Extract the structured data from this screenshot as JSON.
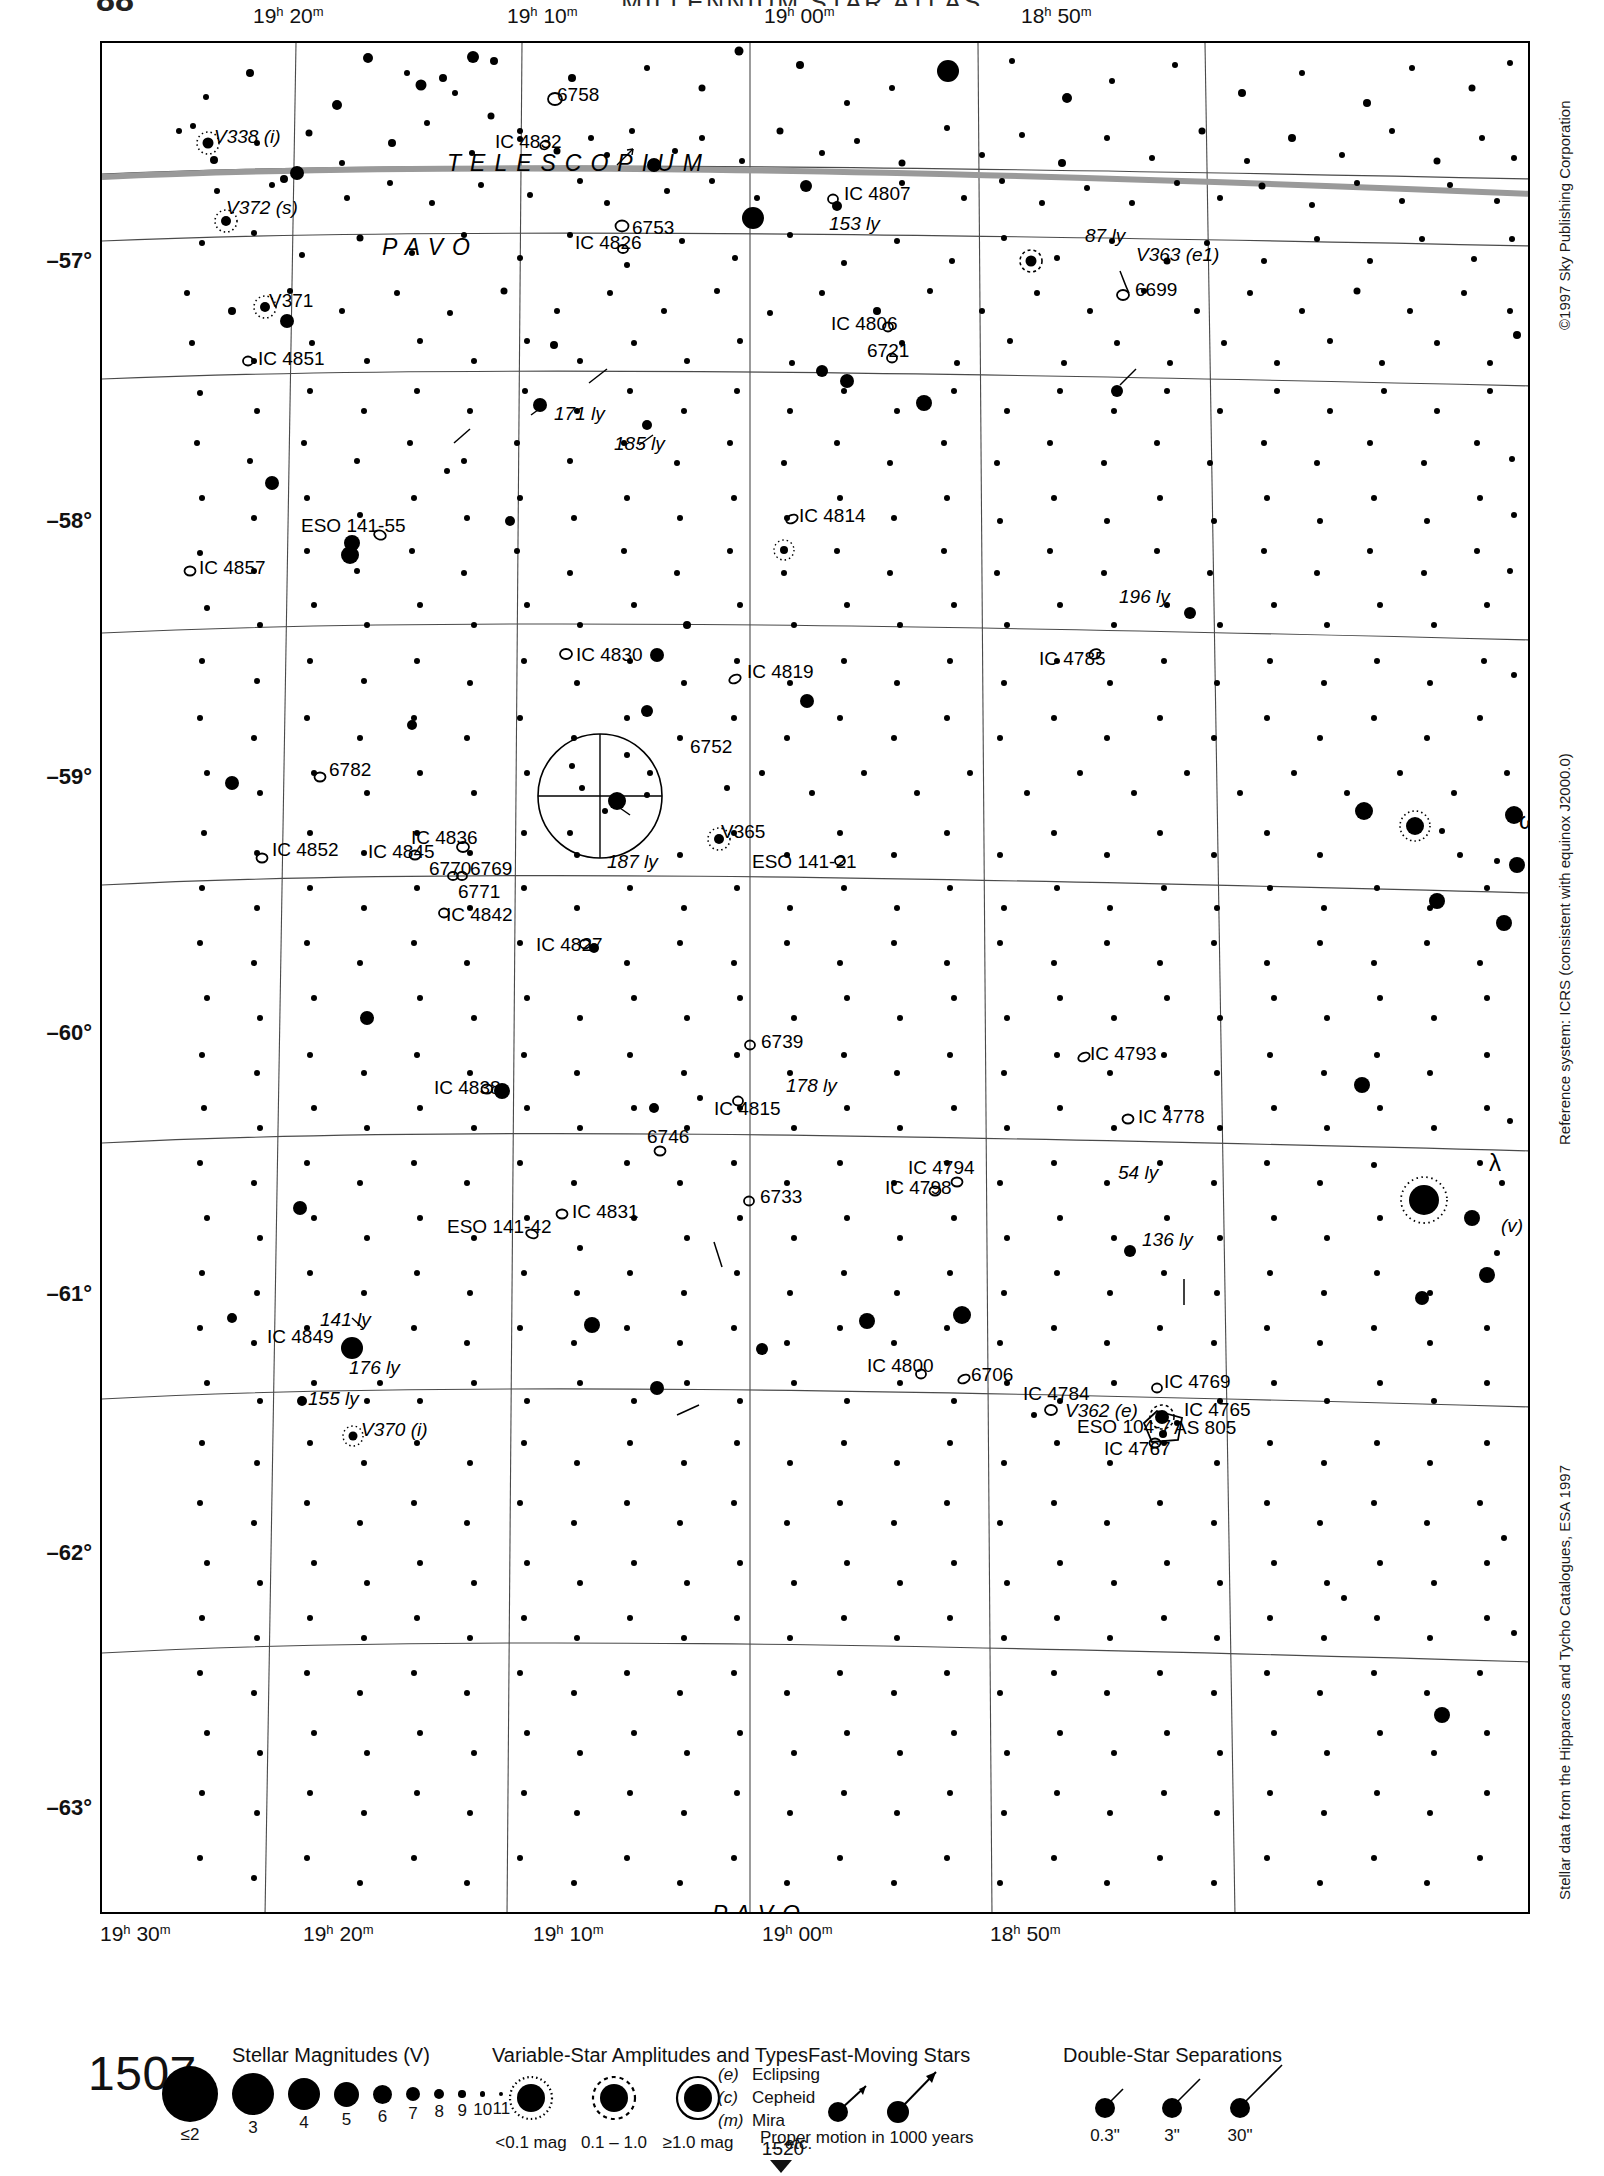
{
  "header": {
    "atlas_title": "MILLENNIUM STAR ATLAS",
    "page_number": "88"
  },
  "chart": {
    "number": "1507",
    "next_chart": "1520",
    "ra_labels_top": [
      "19h 20m",
      "19h 10m",
      "19h 00m",
      "18h 50m"
    ],
    "ra_labels_bottom": [
      "19h 30m",
      "19h 20m",
      "19h 10m",
      "19h 00m",
      "18h 50m"
    ],
    "dec_labels": [
      "–57°",
      "–58°",
      "–59°",
      "–60°",
      "–61°",
      "–62°",
      "–63°"
    ],
    "constellation_labels": [
      {
        "name": "TELESCOPIUM",
        "x": 345,
        "y": 128,
        "size": 23,
        "spacing": 9
      },
      {
        "name": "PAVO",
        "x": 280,
        "y": 212,
        "size": 23,
        "spacing": 9
      },
      {
        "name": "PAVO",
        "x": 610,
        "y": 1879,
        "size": 23,
        "spacing": 9
      }
    ]
  },
  "margins": {
    "copyright": "©1997 Sky Publishing Corporation",
    "reference_system": "Reference system: ICRS (consistent with equinox J2000.0)",
    "data_source": "Stellar data from the Hipparcos and Tycho Catalogues, ESA 1997"
  },
  "legend": {
    "magnitudes": {
      "title": "Stellar Magnitudes (V)",
      "labels": [
        "≤2",
        "3",
        "4",
        "5",
        "6",
        "7",
        "8",
        "9",
        "10",
        "11"
      ],
      "radii": [
        28,
        21,
        16,
        12.5,
        9.5,
        7,
        5.2,
        3.8,
        2.7,
        1.9
      ]
    },
    "variable_stars": {
      "title": "Variable-Star Amplitudes and Types",
      "amplitude_labels": [
        "<0.1 mag",
        "0.1 – 1.0",
        "≥1.0 mag"
      ],
      "types": [
        {
          "code": "(e)",
          "label": "Eclipsing"
        },
        {
          "code": "(c)",
          "label": "Cepheid"
        },
        {
          "code": "(m)",
          "label": "Mira"
        },
        {
          "code": "",
          "label": "... etc."
        }
      ]
    },
    "fast_moving": {
      "title": "Fast-Moving Stars",
      "caption": "Proper motion in 1000 years"
    },
    "double_stars": {
      "title": "Double-Star Separations",
      "labels": [
        "0.3\"",
        "3\"",
        "30\""
      ]
    }
  },
  "chart_data": {
    "type": "scatter",
    "xlabel": "Right Ascension (J2000)",
    "ylabel": "Declination (J2000)",
    "xlim": [
      "19h 32m",
      "18h 48m"
    ],
    "ylim": [
      -63.6,
      -56.4
    ],
    "grid": true,
    "legend_position": "bottom",
    "object_labels": [
      {
        "text": "V338 (i)",
        "x": 112,
        "y": 100,
        "italic_tail": true
      },
      {
        "text": "6758",
        "x": 455,
        "y": 58,
        "italic_tail": false
      },
      {
        "text": "IC 4832",
        "x": 393,
        "y": 105,
        "italic_tail": false
      },
      {
        "text": "IC 4807",
        "x": 742,
        "y": 157,
        "italic_tail": false
      },
      {
        "text": "153 ly",
        "x": 727,
        "y": 187,
        "italic_tail": true
      },
      {
        "text": "87 ly",
        "x": 983,
        "y": 199,
        "italic_tail": true
      },
      {
        "text": "V363 (e1)",
        "x": 1034,
        "y": 218,
        "italic_tail": true
      },
      {
        "text": "6699",
        "x": 1033,
        "y": 253,
        "italic_tail": false
      },
      {
        "text": "V372 (s)",
        "x": 124,
        "y": 171,
        "italic_tail": true
      },
      {
        "text": "6753",
        "x": 530,
        "y": 191,
        "italic_tail": false
      },
      {
        "text": "IC 4826",
        "x": 473,
        "y": 206,
        "italic_tail": false
      },
      {
        "text": "IC 4806",
        "x": 729,
        "y": 287,
        "italic_tail": false
      },
      {
        "text": "6721",
        "x": 765,
        "y": 314,
        "italic_tail": false
      },
      {
        "text": "V371",
        "x": 167,
        "y": 264,
        "italic_tail": false
      },
      {
        "text": "IC 4851",
        "x": 156,
        "y": 322,
        "italic_tail": false
      },
      {
        "text": "171 ly",
        "x": 452,
        "y": 377,
        "italic_tail": true
      },
      {
        "text": "185 ly",
        "x": 512,
        "y": 407,
        "italic_tail": true
      },
      {
        "text": "IC 4814",
        "x": 697,
        "y": 479,
        "italic_tail": false
      },
      {
        "text": "ESO 141-55",
        "x": 199,
        "y": 489,
        "italic_tail": false
      },
      {
        "text": "IC 4857",
        "x": 97,
        "y": 531,
        "italic_tail": false
      },
      {
        "text": "196 ly",
        "x": 1017,
        "y": 560,
        "italic_tail": true
      },
      {
        "text": "IC 4830",
        "x": 474,
        "y": 618,
        "italic_tail": false
      },
      {
        "text": "IC 4819",
        "x": 645,
        "y": 635,
        "italic_tail": false
      },
      {
        "text": "IC 4785",
        "x": 937,
        "y": 622,
        "italic_tail": false
      },
      {
        "text": "6752",
        "x": 588,
        "y": 710,
        "italic_tail": false
      },
      {
        "text": "6782",
        "x": 227,
        "y": 733,
        "italic_tail": false
      },
      {
        "text": "V365",
        "x": 619,
        "y": 795,
        "italic_tail": false
      },
      {
        "text": "ω",
        "x": 1417,
        "y": 786,
        "italic_tail": false
      },
      {
        "text": "IC 4836",
        "x": 309,
        "y": 801,
        "italic_tail": false
      },
      {
        "text": "187 ly",
        "x": 505,
        "y": 825,
        "italic_tail": true
      },
      {
        "text": "IC 4852",
        "x": 170,
        "y": 813,
        "italic_tail": false
      },
      {
        "text": "IC 4845",
        "x": 266,
        "y": 815,
        "italic_tail": false
      },
      {
        "text": "ESO 141-21",
        "x": 650,
        "y": 825,
        "italic_tail": false
      },
      {
        "text": "6770",
        "x": 327,
        "y": 832,
        "italic_tail": false
      },
      {
        "text": "6769",
        "x": 368,
        "y": 832,
        "italic_tail": false
      },
      {
        "text": "6771",
        "x": 356,
        "y": 855,
        "italic_tail": false
      },
      {
        "text": "IC 4842",
        "x": 344,
        "y": 878,
        "italic_tail": false
      },
      {
        "text": "IC 4827",
        "x": 434,
        "y": 908,
        "italic_tail": false
      },
      {
        "text": "6739",
        "x": 659,
        "y": 1005,
        "italic_tail": false
      },
      {
        "text": "IC 4793",
        "x": 988,
        "y": 1017,
        "italic_tail": false
      },
      {
        "text": "IC 4838",
        "x": 332,
        "y": 1051,
        "italic_tail": false
      },
      {
        "text": "178 ly",
        "x": 684,
        "y": 1049,
        "italic_tail": true
      },
      {
        "text": "IC 4815",
        "x": 612,
        "y": 1072,
        "italic_tail": false
      },
      {
        "text": "IC 4778",
        "x": 1036,
        "y": 1080,
        "italic_tail": false
      },
      {
        "text": "6746",
        "x": 545,
        "y": 1100,
        "italic_tail": false
      },
      {
        "text": "IC 4794",
        "x": 806,
        "y": 1131,
        "italic_tail": false
      },
      {
        "text": "54 ly",
        "x": 1016,
        "y": 1136,
        "italic_tail": true
      },
      {
        "text": "IC 4798",
        "x": 783,
        "y": 1151,
        "italic_tail": false
      },
      {
        "text": "λ",
        "x": 1387,
        "y": 1128,
        "italic_tail": false
      },
      {
        "text": "6733",
        "x": 658,
        "y": 1160,
        "italic_tail": false
      },
      {
        "text": "IC 4831",
        "x": 470,
        "y": 1175,
        "italic_tail": false
      },
      {
        "text": "(v)",
        "x": 1399,
        "y": 1189,
        "italic_tail": true
      },
      {
        "text": "136 ly",
        "x": 1040,
        "y": 1203,
        "italic_tail": true
      },
      {
        "text": "ESO 141-42",
        "x": 345,
        "y": 1190,
        "italic_tail": false
      },
      {
        "text": "141 ly",
        "x": 218,
        "y": 1283,
        "italic_tail": true
      },
      {
        "text": "IC 4849",
        "x": 165,
        "y": 1300,
        "italic_tail": false
      },
      {
        "text": "176 ly",
        "x": 247,
        "y": 1331,
        "italic_tail": true
      },
      {
        "text": "IC 4800",
        "x": 765,
        "y": 1329,
        "italic_tail": false
      },
      {
        "text": "6706",
        "x": 869,
        "y": 1338,
        "italic_tail": false
      },
      {
        "text": "IC 4769",
        "x": 1062,
        "y": 1345,
        "italic_tail": false
      },
      {
        "text": "155 ly",
        "x": 206,
        "y": 1362,
        "italic_tail": true
      },
      {
        "text": "IC 4784",
        "x": 921,
        "y": 1357,
        "italic_tail": false
      },
      {
        "text": "V362 (e)",
        "x": 963,
        "y": 1374,
        "italic_tail": true
      },
      {
        "text": "IC 4765",
        "x": 1082,
        "y": 1373,
        "italic_tail": false
      },
      {
        "text": "ESO 104-7",
        "x": 975,
        "y": 1390,
        "italic_tail": false
      },
      {
        "text": "AS 805",
        "x": 1072,
        "y": 1391,
        "italic_tail": false
      },
      {
        "text": "V370 (i)",
        "x": 259,
        "y": 1393,
        "italic_tail": true
      },
      {
        "text": "IC 4767",
        "x": 1002,
        "y": 1412,
        "italic_tail": false
      }
    ]
  }
}
